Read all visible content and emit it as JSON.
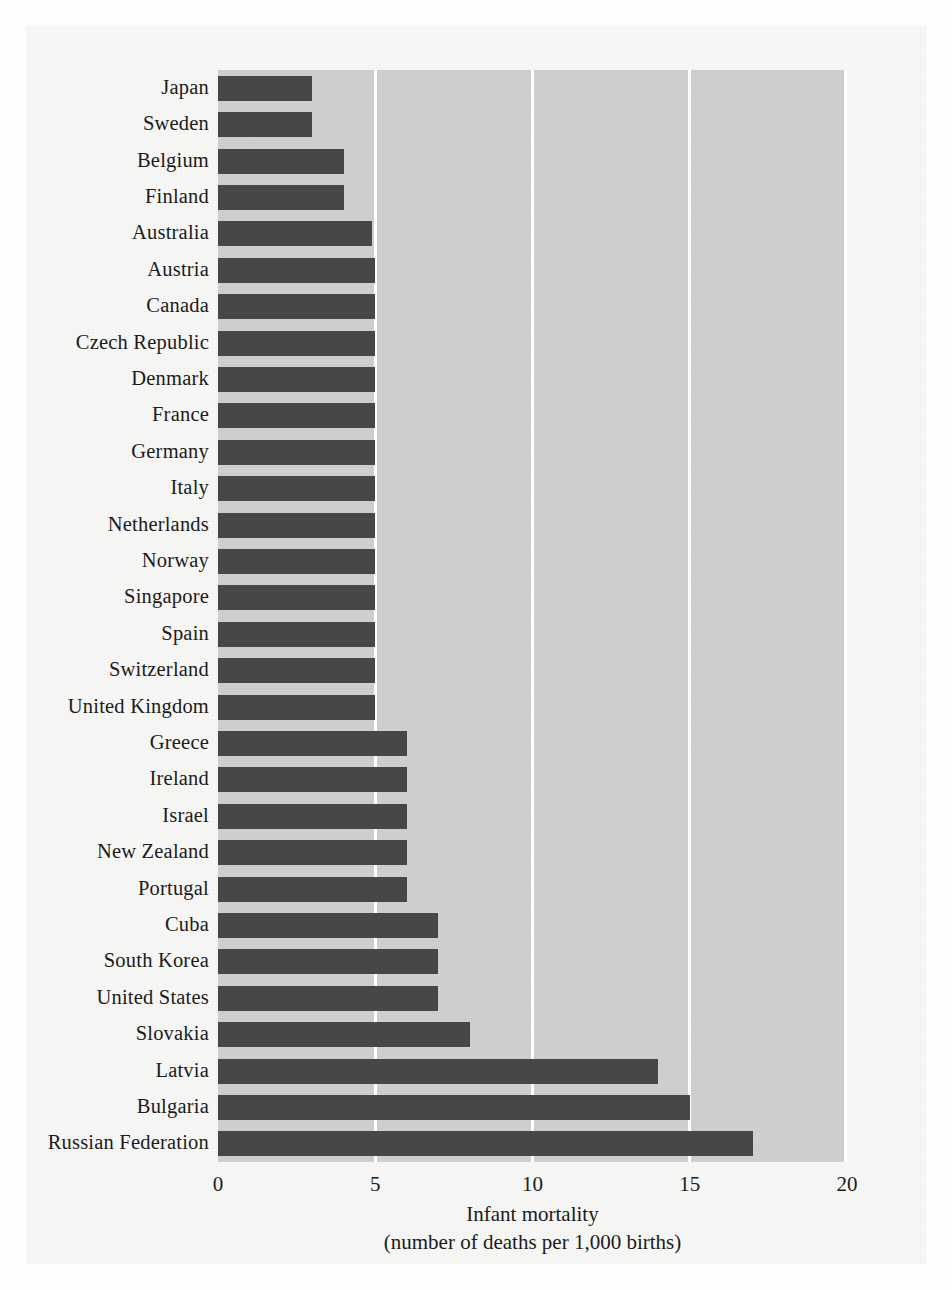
{
  "chart_data": {
    "type": "bar",
    "orientation": "horizontal",
    "title": "",
    "xlabel": "Infant mortality",
    "xlabel_line2": "(number of deaths per 1,000 births)",
    "ylabel": "",
    "xlim": [
      0,
      20
    ],
    "xticks": [
      0,
      5,
      10,
      15,
      20
    ],
    "xtick_labels": [
      "0",
      "5",
      "10",
      "15",
      "20"
    ],
    "grid": "vertical-white-gridlines",
    "legend": "none",
    "bar_color": "#474747",
    "plot_background": "#cdcdcd",
    "page_background": "#f7f7f5",
    "gridline_color": "#ffffff",
    "categories": [
      "Japan",
      "Sweden",
      "Belgium",
      "Finland",
      "Australia",
      "Austria",
      "Canada",
      "Czech Republic",
      "Denmark",
      "France",
      "Germany",
      "Italy",
      "Netherlands",
      "Norway",
      "Singapore",
      "Spain",
      "Switzerland",
      "United Kingdom",
      "Greece",
      "Ireland",
      "Israel",
      "New Zealand",
      "Portugal",
      "Cuba",
      "South Korea",
      "United States",
      "Slovakia",
      "Latvia",
      "Bulgaria",
      "Russian Federation"
    ],
    "values": [
      3,
      3,
      4,
      4,
      4.9,
      5,
      5,
      5,
      5,
      5,
      5,
      5,
      5,
      5,
      5,
      5,
      5,
      5,
      6,
      6,
      6,
      6,
      6,
      7,
      7,
      7,
      8,
      14,
      15,
      17
    ]
  }
}
